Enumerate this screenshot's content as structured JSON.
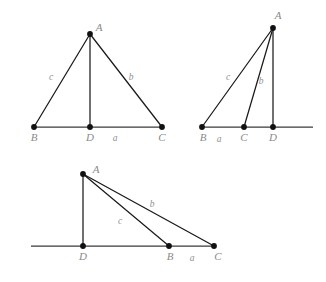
{
  "figure": {
    "background_color": "#ffffff",
    "line_color": "#1a1a1a",
    "vertex_color": "#111111",
    "label_color": "#8a8a8a",
    "width": 326,
    "height": 282
  },
  "diagrams": [
    {
      "name": "acute-triangle",
      "caption": "",
      "vertices": [
        {
          "id": "A",
          "label": "A",
          "x": 90,
          "y": 34,
          "label_x": 99,
          "label_y": 28
        },
        {
          "id": "B",
          "label": "B",
          "x": 34,
          "y": 127,
          "label_x": 34,
          "label_y": 137
        },
        {
          "id": "D",
          "label": "D",
          "x": 90,
          "y": 127,
          "label_x": 90,
          "label_y": 137
        },
        {
          "id": "C",
          "label": "C",
          "x": 162,
          "y": 127,
          "label_x": 162,
          "label_y": 137
        }
      ],
      "segments": [
        {
          "name": "side-c",
          "from": "A",
          "to": "B"
        },
        {
          "name": "side-b",
          "from": "A",
          "to": "C"
        },
        {
          "name": "altitude-AD",
          "from": "A",
          "to": "D"
        },
        {
          "name": "base-BC",
          "from": "B",
          "to": "C",
          "baseline": true
        }
      ],
      "side_labels": [
        {
          "id": "c",
          "label": "c",
          "x": 51,
          "y": 78
        },
        {
          "id": "b",
          "label": "b",
          "x": 131,
          "y": 78
        },
        {
          "id": "a",
          "label": "a",
          "x": 115,
          "y": 138
        }
      ]
    },
    {
      "name": "obtuse-triangle-foot-right",
      "caption": "",
      "vertices": [
        {
          "id": "A",
          "label": "A",
          "x": 273,
          "y": 28,
          "label_x": 277,
          "label_y": 16
        },
        {
          "id": "B",
          "label": "B",
          "x": 202,
          "y": 127,
          "label_x": 203,
          "label_y": 137
        },
        {
          "id": "C",
          "label": "C",
          "x": 244,
          "y": 127,
          "label_x": 244,
          "label_y": 137
        },
        {
          "id": "D",
          "label": "D",
          "x": 273,
          "y": 127,
          "label_x": 273,
          "label_y": 137
        }
      ],
      "segments": [
        {
          "name": "side-c",
          "from": "A",
          "to": "B"
        },
        {
          "name": "side-b",
          "from": "A",
          "to": "C"
        },
        {
          "name": "altitude-AD",
          "from": "A",
          "to": "D"
        },
        {
          "name": "baseline-extended",
          "from": "B",
          "to": "line-end",
          "baseline": true
        }
      ],
      "baseline": {
        "x1": 202,
        "x2": 313,
        "y": 127
      },
      "side_labels": [
        {
          "id": "c",
          "label": "c",
          "x": 228,
          "y": 78
        },
        {
          "id": "b",
          "label": "b",
          "x": 261,
          "y": 82
        },
        {
          "id": "a",
          "label": "a",
          "x": 219,
          "y": 139
        }
      ]
    },
    {
      "name": "obtuse-triangle-foot-left",
      "caption": "",
      "vertices": [
        {
          "id": "A",
          "label": "A",
          "x": 83,
          "y": 174,
          "label_x": 96,
          "label_y": 170
        },
        {
          "id": "D",
          "label": "D",
          "x": 83,
          "y": 246,
          "label_x": 83,
          "label_y": 256
        },
        {
          "id": "B",
          "label": "B",
          "x": 169,
          "y": 246,
          "label_x": 170,
          "label_y": 256
        },
        {
          "id": "C",
          "label": "C",
          "x": 214,
          "y": 246,
          "label_x": 218,
          "label_y": 256
        }
      ],
      "segments": [
        {
          "name": "side-c",
          "from": "A",
          "to": "B"
        },
        {
          "name": "side-b",
          "from": "A",
          "to": "C"
        },
        {
          "name": "altitude-AD",
          "from": "A",
          "to": "D"
        },
        {
          "name": "baseline-extended",
          "from": "line-start",
          "to": "C",
          "baseline": true
        }
      ],
      "baseline": {
        "x1": 31,
        "x2": 214,
        "y": 246
      },
      "side_labels": [
        {
          "id": "b",
          "label": "b",
          "x": 152,
          "y": 205
        },
        {
          "id": "c",
          "label": "c",
          "x": 120,
          "y": 222
        },
        {
          "id": "a",
          "label": "a",
          "x": 192,
          "y": 258
        }
      ]
    }
  ]
}
